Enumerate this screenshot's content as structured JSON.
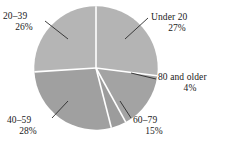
{
  "chart_data": {
    "type": "pie",
    "title": "",
    "subtitle": "",
    "xlabel": "",
    "ylabel": "",
    "legend_position": "none",
    "grid": false,
    "labels_outside": true,
    "start_angle_deg": 0,
    "direction": "clockwise",
    "categories": [
      "Under 20",
      "60–79",
      "80 and older",
      "40–59",
      "20–39"
    ],
    "values": [
      27,
      15,
      4,
      28,
      26
    ],
    "value_unit": "%",
    "colors": [
      "#b4b4b4",
      "#a3a3a3",
      "#9c9c9c",
      "#a0a0a0",
      "#b5b5b5"
    ],
    "separator_color": "#ffffff",
    "leader_line_color": "#2b2b2b",
    "slices": [
      {
        "name": "Under 20",
        "value": 27,
        "percent_text": "27%",
        "color": "#b4b4b4",
        "start_angle_deg": 0,
        "end_angle_deg": 97.2
      },
      {
        "name": "60–79",
        "value": 15,
        "percent_text": "15%",
        "color": "#a3a3a3",
        "start_angle_deg": 97.2,
        "end_angle_deg": 111.6
      },
      {
        "name": "80 and older",
        "value": 4,
        "percent_text": "4%",
        "color": "#9c9c9c",
        "start_angle_deg": 111.6,
        "end_angle_deg": 165.6
      },
      {
        "name": "40–59",
        "value": 28,
        "percent_text": "28%",
        "color": "#a0a0a0",
        "start_angle_deg": 165.6,
        "end_angle_deg": 266.4
      },
      {
        "name": "20–39",
        "value": 26,
        "percent_text": "26%",
        "color": "#b5b5b5",
        "start_angle_deg": 266.4,
        "end_angle_deg": 360
      }
    ]
  },
  "labels": {
    "under_20": {
      "name": "Under 20",
      "percent": "27%"
    },
    "age_20_39": {
      "name": "20–39",
      "percent": "26%"
    },
    "age_40_59": {
      "name": "40–59",
      "percent": "28%"
    },
    "age_60_79": {
      "name": "60–79",
      "percent": "15%"
    },
    "age_80_older": {
      "name": "80 and older",
      "percent": "4%"
    }
  }
}
